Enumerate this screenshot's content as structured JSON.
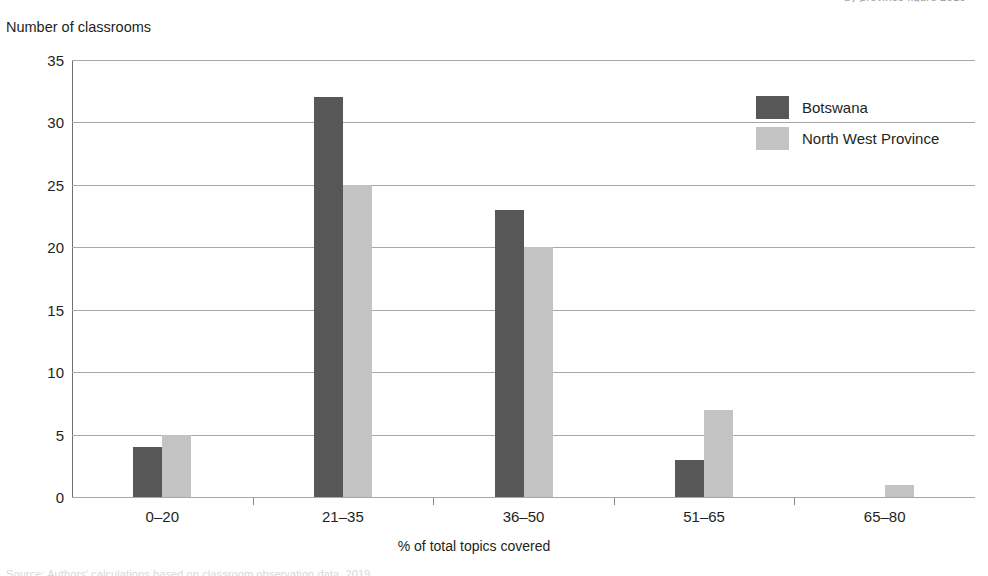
{
  "page": {
    "cutoff_top_text": "by province figure 2019",
    "cutoff_bottom_text": "Source: Authors' calculations based on classroom observation data, 2019."
  },
  "chart_data": {
    "type": "bar",
    "title": "",
    "subtitle": "",
    "xlabel": "% of total topics covered",
    "ylabel": "Number of classrooms",
    "categories": [
      "0–20",
      "21–35",
      "36–50",
      "51–65",
      "65–80"
    ],
    "series": [
      {
        "name": "Botswana",
        "color": "#575757",
        "values": [
          4,
          32,
          23,
          3,
          0
        ]
      },
      {
        "name": "North West Province",
        "color": "#c3c3c3",
        "values": [
          5,
          25,
          20,
          7,
          1
        ]
      }
    ],
    "ylim": [
      0,
      35
    ],
    "ytick_labels": [
      "0",
      "5",
      "10",
      "15",
      "20",
      "25",
      "30",
      "35"
    ],
    "ytick_values": [
      0,
      5,
      10,
      15,
      20,
      25,
      30,
      35
    ],
    "grid": true,
    "grid_axis": "y",
    "legend_position": "top-right"
  }
}
